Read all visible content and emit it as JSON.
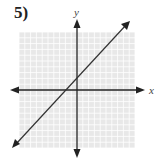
{
  "problem": {
    "label": "5)"
  },
  "chart_data": {
    "type": "line",
    "title": "",
    "xlabel": "x",
    "ylabel": "y",
    "xlim": [
      -10,
      10
    ],
    "ylim": [
      -10,
      10
    ],
    "grid": true,
    "series": [
      {
        "name": "y = x + 2",
        "x": [
          -10,
          10
        ],
        "y": [
          -8,
          12
        ]
      }
    ],
    "intercepts": {
      "x_intercept": -2,
      "y_intercept": 2
    },
    "slope": 1
  },
  "axes": {
    "x_label": "x",
    "y_label": "y"
  },
  "colors": {
    "grid": "#d4d4d4",
    "grid_bg": "#e8e8e8",
    "axis": "#222222",
    "line": "#333333"
  }
}
